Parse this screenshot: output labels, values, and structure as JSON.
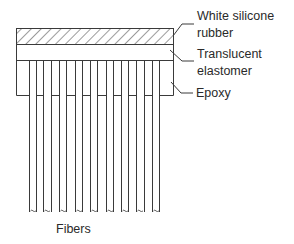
{
  "diagram": {
    "type": "cross-section",
    "layers": [
      {
        "id": "rubber",
        "label_lines": [
          "White silicone",
          "rubber"
        ],
        "pattern": "diagonal-hatch"
      },
      {
        "id": "elastomer",
        "label_lines": [
          "Translucent",
          "elastomer"
        ],
        "pattern": "none"
      },
      {
        "id": "epoxy",
        "label_lines": [
          "Epoxy"
        ],
        "pattern": "none"
      }
    ],
    "fibers": {
      "label": "Fibers",
      "count": 9
    },
    "colors": {
      "line": "#3a3a3a",
      "background": "#ffffff"
    }
  }
}
